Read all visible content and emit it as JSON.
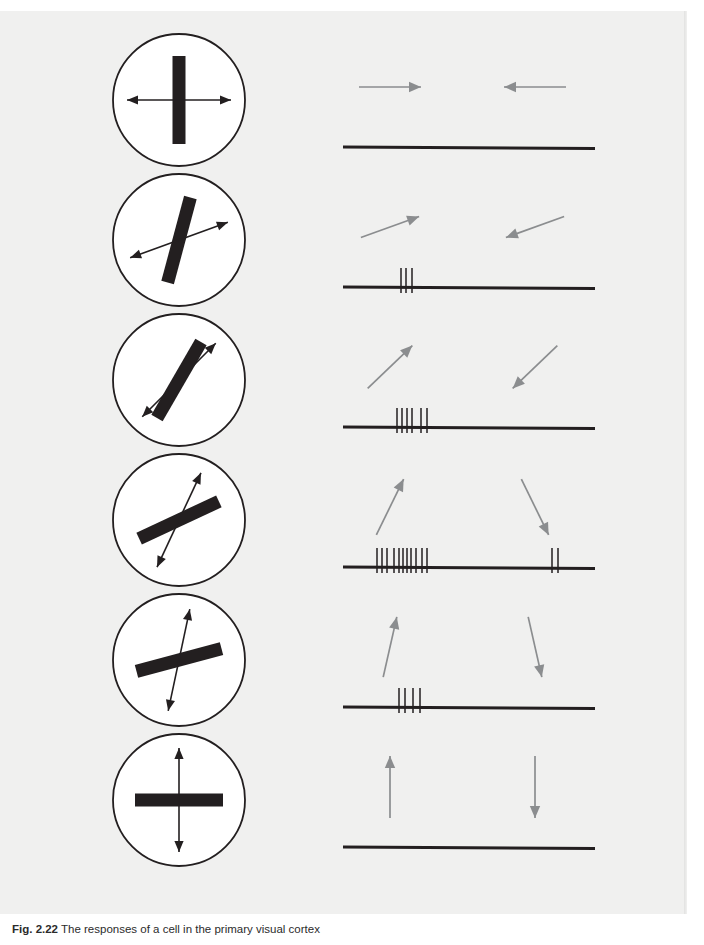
{
  "figure": {
    "background_color": "#f0f0ef",
    "ink_color": "#231f20",
    "arrow_color": "#8b8d8f",
    "caption_label": "Fig. 2.22",
    "caption_text": "The responses of a cell in the primary visual cortex",
    "axis": {
      "baseline_x_start": 8,
      "baseline_x_end": 260,
      "baseline_y": 118
    },
    "columns": [
      {
        "name": "stimulus",
        "description": "oriented bar within circular aperture with double-headed motion axis arrow"
      },
      {
        "name": "response",
        "description": "spike raster on a time baseline with motion direction arrows"
      }
    ],
    "rows": [
      {
        "index": 1,
        "bar_angle_deg": 90,
        "arrow_axis_angle_deg": 0,
        "motion_arrow_1": "right",
        "motion_arrow_2": "left",
        "spikes_left": [],
        "spikes_right": [],
        "spike_count": 0
      },
      {
        "index": 2,
        "bar_angle_deg": 75,
        "arrow_axis_angle_deg": 20,
        "motion_arrow_1": "up-right",
        "motion_arrow_2": "down-left",
        "spikes_left": [
          58,
          63,
          69
        ],
        "spikes_right": [],
        "spike_count": 3
      },
      {
        "index": 3,
        "bar_angle_deg": 60,
        "arrow_axis_angle_deg": 45,
        "motion_arrow_1": "up-right-45",
        "motion_arrow_2": "down-left-45",
        "spikes_left": [
          54,
          59,
          64,
          69,
          78,
          84
        ],
        "spikes_right": [],
        "spike_count": 6
      },
      {
        "index": 4,
        "bar_angle_deg": 25,
        "arrow_axis_angle_deg": 65,
        "motion_arrow_1": "up-right-steep",
        "motion_arrow_2": "down-right-steep",
        "spikes_left": [
          34,
          39,
          44,
          51,
          56,
          60,
          64,
          68,
          73,
          79,
          84
        ],
        "spikes_right": [
          209,
          215
        ],
        "spike_count": 13
      },
      {
        "index": 5,
        "bar_angle_deg": 15,
        "arrow_axis_angle_deg": 78,
        "motion_arrow_1": "up-steep",
        "motion_arrow_2": "down-steep",
        "spikes_left": [
          56,
          62,
          70,
          77
        ],
        "spikes_right": [],
        "spike_count": 4
      },
      {
        "index": 6,
        "bar_angle_deg": 0,
        "arrow_axis_angle_deg": 90,
        "motion_arrow_1": "up",
        "motion_arrow_2": "down",
        "spikes_left": [],
        "spikes_right": [],
        "spike_count": 0
      }
    ]
  }
}
